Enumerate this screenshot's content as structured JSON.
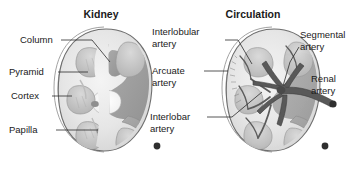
{
  "figure": {
    "background_color": "#ffffff",
    "panels": [
      {
        "id": "kidney",
        "title": "Kidney",
        "labels": [
          {
            "id": "column",
            "text": "Column"
          },
          {
            "id": "pyramid",
            "text": "Pyramid"
          },
          {
            "id": "cortex",
            "text": "Cortex"
          },
          {
            "id": "papilla",
            "text": "Papilla"
          }
        ]
      },
      {
        "id": "circulation",
        "title": "Circulation",
        "labels": [
          {
            "id": "interlobular-artery",
            "line1": "Interlobular",
            "line2": "artery"
          },
          {
            "id": "arcuate-artery",
            "line1": "Arcuate",
            "line2": "artery"
          },
          {
            "id": "interlobar-artery",
            "line1": "Interlobar",
            "line2": "artery"
          },
          {
            "id": "segmental-artery",
            "line1": "Segmental",
            "line2": "artery"
          },
          {
            "id": "renal-artery",
            "line1": "Renal",
            "line2": "artery"
          }
        ]
      }
    ],
    "colors": {
      "text": "#1a1a1a",
      "leader_line": "#2b2b2b",
      "capsule": "#8a8a8a",
      "outline": "#6e6e6e",
      "cortex_fill": "#e8e8e8",
      "medulla_fill": "#cfcfcf",
      "pelvis_fill": "#9d9d9d",
      "vessel_dark": "#595959",
      "calyx_white": "#fbfbfb"
    }
  }
}
